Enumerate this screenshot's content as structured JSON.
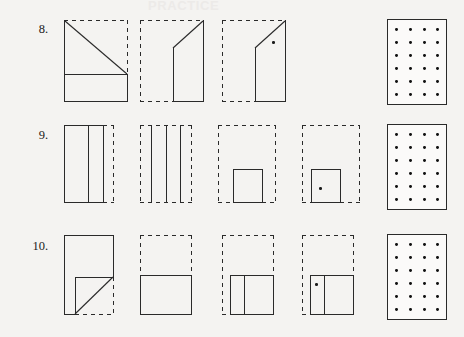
{
  "page": {
    "background_color": "#f4f3f1",
    "ink_color": "#2a2a2a",
    "faint_header_text": "PRACTICE"
  },
  "rows": [
    {
      "number_label": "8.",
      "panels": [
        {
          "name": "figure-8-1",
          "caption": "square with diagonal, solid left and bottom, dashed top-right"
        },
        {
          "name": "figure-8-2",
          "caption": "folded shape, dashed outline left, solid slanted flap right"
        },
        {
          "name": "figure-8-3",
          "caption": "folded shape with dot, dashed outline left, solid flap right"
        },
        {
          "name": "answer-grid-8",
          "caption": "dot grid answer box"
        }
      ]
    },
    {
      "number_label": "9.",
      "panels": [
        {
          "name": "figure-9-1",
          "caption": "solid rectangle with vertical creases, dashed right edge"
        },
        {
          "name": "figure-9-2",
          "caption": "dashed rectangle with three vertical creases"
        },
        {
          "name": "figure-9-3",
          "caption": "small solid rectangle centered at bottom of dashed box"
        },
        {
          "name": "figure-9-4",
          "caption": "small solid rectangle with dot, left of dashed box"
        },
        {
          "name": "answer-grid-9",
          "caption": "dot grid answer box"
        }
      ]
    },
    {
      "number_label": "10.",
      "panels": [
        {
          "name": "figure-10-1",
          "caption": "solid rectangle with lower-left diagonal fold, dashed bottom right"
        },
        {
          "name": "figure-10-2",
          "caption": "dashed upper half with solid lower square"
        },
        {
          "name": "figure-10-3",
          "caption": "solid lower square with vertical crease, dashed upper area"
        },
        {
          "name": "figure-10-4",
          "caption": "solid lower square with dot in left strip, dashed upper area"
        },
        {
          "name": "answer-grid-10",
          "caption": "dot grid answer box"
        }
      ]
    }
  ],
  "answer_grid": {
    "columns": 4,
    "rows": 6
  }
}
